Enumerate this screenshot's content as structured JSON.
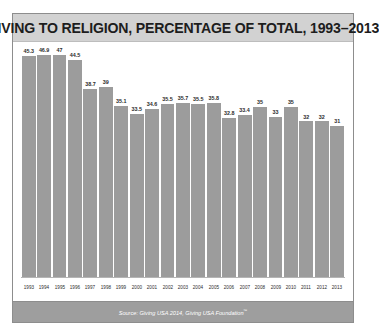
{
  "chart_data": {
    "type": "bar",
    "title": "GIVING TO RELIGION, PERCENTAGE OF TOTAL, 1993–2013",
    "xlabel": "",
    "ylabel": "",
    "ylim": [
      0,
      47
    ],
    "grid": false,
    "legend": false,
    "categories": [
      "1993",
      "1994",
      "1995",
      "1996",
      "1997",
      "1998",
      "1999",
      "2000",
      "2001",
      "2002",
      "2003",
      "2004",
      "2005",
      "2006",
      "2007",
      "2008",
      "2009",
      "2010",
      "2011",
      "2012",
      "2013"
    ],
    "values": [
      45.3,
      46.9,
      47,
      44.5,
      38.7,
      39,
      35.1,
      33.5,
      34.6,
      35.5,
      35.7,
      35.5,
      35.8,
      32.8,
      33.4,
      35,
      33,
      35,
      32,
      32,
      31
    ],
    "value_labels": [
      "45.3",
      "46.9",
      "47",
      "44.5",
      "38.7",
      "39",
      "35.1",
      "33.5",
      "34.6",
      "35.5",
      "35.7",
      "35.5",
      "35.8",
      "32.8",
      "33.4",
      "35",
      "33",
      "35",
      "32",
      "32",
      "31"
    ],
    "series": [
      {
        "name": "Giving to religion, percentage of total",
        "values": [
          45.3,
          46.9,
          47,
          44.5,
          38.7,
          39,
          35.1,
          33.5,
          34.6,
          35.5,
          35.7,
          35.5,
          35.8,
          32.8,
          33.4,
          35,
          33,
          35,
          32,
          32,
          31
        ]
      }
    ],
    "bar_color": "#9c9c9c"
  },
  "footer": {
    "source_prefix": "Source: Giving USA 2014, Giving USA Foundation",
    "trademark": "™"
  }
}
